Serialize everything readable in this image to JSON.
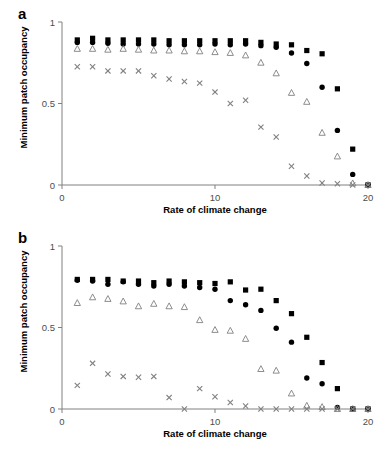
{
  "figure": {
    "panels": [
      {
        "letter": "a",
        "xlabel": "Rate of climate change",
        "ylabel": "Minimum patch occupancy"
      },
      {
        "letter": "b",
        "xlabel": "Rate of climate change",
        "ylabel": "Minimum patch occupancy"
      }
    ],
    "axis_color": "#808080",
    "marker_color": "#000000",
    "open_marker_color": "#808080",
    "cross_color": "#808080"
  },
  "chart_data": [
    {
      "type": "scatter",
      "title": "a",
      "panel": "a",
      "xlabel": "Rate of climate change",
      "ylabel": "Minimum patch occupancy",
      "xlim": [
        0,
        20
      ],
      "ylim": [
        0,
        1
      ],
      "xticks": [
        0,
        10,
        20
      ],
      "xtick_labels": [
        "0",
        "10",
        "20"
      ],
      "yticks": [
        0,
        0.5,
        1
      ],
      "ytick_labels": [
        "0",
        "0.5",
        "1"
      ],
      "grid": false,
      "legend": "none",
      "x": [
        1,
        2,
        3,
        4,
        5,
        6,
        7,
        8,
        9,
        10,
        11,
        12,
        13,
        14,
        15,
        16,
        17,
        18,
        19,
        20
      ],
      "series": [
        {
          "name": "filled-square",
          "marker": "square",
          "filled": true,
          "color": "#000000",
          "values": [
            0.89,
            0.9,
            0.89,
            0.89,
            0.89,
            0.89,
            0.885,
            0.885,
            0.885,
            0.885,
            0.885,
            0.885,
            0.875,
            0.865,
            0.86,
            0.825,
            0.805,
            0.59,
            0.22,
            0.0
          ]
        },
        {
          "name": "filled-circle",
          "marker": "circle",
          "filled": true,
          "color": "#000000",
          "values": [
            0.875,
            0.875,
            0.87,
            0.865,
            0.865,
            0.865,
            0.86,
            0.86,
            0.86,
            0.865,
            0.86,
            0.865,
            0.855,
            0.845,
            0.81,
            0.745,
            0.6,
            0.335,
            0.065,
            0.0
          ]
        },
        {
          "name": "open-triangle",
          "marker": "triangle",
          "filled": false,
          "color": "#808080",
          "values": [
            0.835,
            0.835,
            0.83,
            0.835,
            0.83,
            0.825,
            0.825,
            0.82,
            0.82,
            0.815,
            0.81,
            0.795,
            0.75,
            0.685,
            0.565,
            0.51,
            0.32,
            0.175,
            0.01,
            0.0
          ]
        },
        {
          "name": "cross",
          "marker": "cross",
          "filled": false,
          "color": "#808080",
          "values": [
            0.725,
            0.725,
            0.7,
            0.7,
            0.7,
            0.67,
            0.65,
            0.635,
            0.625,
            0.57,
            0.5,
            0.52,
            0.355,
            0.295,
            0.115,
            0.055,
            0.012,
            0.008,
            0.0,
            0.0
          ]
        }
      ]
    },
    {
      "type": "scatter",
      "title": "b",
      "panel": "b",
      "xlabel": "Rate of climate change",
      "ylabel": "Minimum patch occupancy",
      "xlim": [
        0,
        20
      ],
      "ylim": [
        0,
        1
      ],
      "xticks": [
        0,
        10,
        20
      ],
      "xtick_labels": [
        "0",
        "10",
        "20"
      ],
      "yticks": [
        0,
        0.5,
        1
      ],
      "ytick_labels": [
        "0",
        "0.5",
        "1"
      ],
      "grid": false,
      "legend": "none",
      "x": [
        1,
        2,
        3,
        4,
        5,
        6,
        7,
        8,
        9,
        10,
        11,
        12,
        13,
        14,
        15,
        16,
        17,
        18,
        19,
        20
      ],
      "series": [
        {
          "name": "filled-square",
          "marker": "square",
          "filled": true,
          "color": "#000000",
          "values": [
            0.795,
            0.795,
            0.795,
            0.785,
            0.785,
            0.775,
            0.785,
            0.78,
            0.775,
            0.77,
            0.78,
            0.73,
            0.735,
            0.665,
            0.585,
            0.44,
            0.285,
            0.125,
            0.0,
            0.0
          ]
        },
        {
          "name": "filled-circle",
          "marker": "circle",
          "filled": true,
          "color": "#000000",
          "values": [
            0.79,
            0.785,
            0.765,
            0.78,
            0.765,
            0.755,
            0.765,
            0.755,
            0.745,
            0.735,
            0.665,
            0.64,
            0.605,
            0.495,
            0.41,
            0.19,
            0.155,
            0.01,
            0.0,
            0.0
          ]
        },
        {
          "name": "open-triangle",
          "marker": "triangle",
          "filled": false,
          "color": "#808080",
          "values": [
            0.65,
            0.685,
            0.675,
            0.66,
            0.63,
            0.645,
            0.63,
            0.625,
            0.545,
            0.485,
            0.48,
            0.43,
            0.245,
            0.235,
            0.095,
            0.02,
            0.012,
            0.0,
            0.0,
            0.0
          ]
        },
        {
          "name": "cross",
          "marker": "cross",
          "filled": false,
          "color": "#808080",
          "values": [
            0.145,
            0.28,
            0.215,
            0.2,
            0.195,
            0.2,
            0.07,
            0.0,
            0.125,
            0.075,
            0.04,
            0.018,
            0.0,
            0.0,
            0.0,
            0.0,
            0.0,
            0.0,
            0.0,
            0.0
          ]
        }
      ]
    }
  ]
}
